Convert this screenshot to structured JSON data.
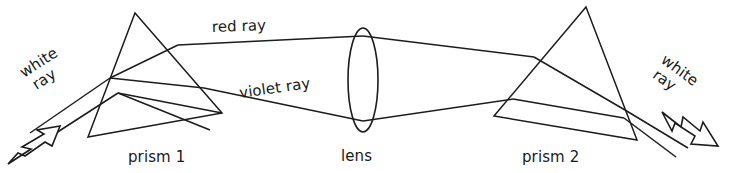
{
  "figure": {
    "background_color": "#ffffff",
    "line_color": "#1c1c1c",
    "width": 734,
    "height": 173
  },
  "labels": {
    "white_ray_left": "white\nray",
    "white_ray_left_line1": "white",
    "white_ray_left_line2": "ray",
    "white_ray_right_line1": "white",
    "white_ray_right_line2": "ray",
    "red_ray": "red ray",
    "violet_ray": "violet ray",
    "prism_1": "prism 1",
    "lens": "lens",
    "prism_2": "prism 2"
  },
  "components": [
    {
      "name": "prism-1",
      "type": "triangle",
      "label": "prism 1",
      "apex": [
        135,
        13
      ],
      "base_left": [
        88,
        137
      ],
      "base_right": [
        222,
        113
      ]
    },
    {
      "name": "lens",
      "type": "ellipse",
      "label": "lens",
      "center": [
        363,
        80
      ],
      "rx": 15,
      "ry": 52
    },
    {
      "name": "prism-2",
      "type": "triangle",
      "label": "prism 2",
      "apex": [
        586,
        7
      ],
      "base_left": [
        494,
        116
      ],
      "base_right": [
        637,
        140
      ]
    }
  ],
  "rays": [
    {
      "name": "white-ray-incoming",
      "label": "white ray",
      "color_name": "white",
      "direction": "into prism 1 from lower left",
      "arrowhead": "outlined-notched-arrow",
      "arrow_points_toward": "upper-right"
    },
    {
      "name": "red-ray",
      "label": "red ray",
      "color_name": "red",
      "path": "upper dispersed ray from prism 1 through lens to prism 2"
    },
    {
      "name": "violet-ray",
      "label": "violet ray",
      "color_name": "violet",
      "path": "lower dispersed ray from prism 1 through lens to prism 2"
    },
    {
      "name": "white-ray-outgoing",
      "label": "white ray",
      "color_name": "white",
      "direction": "out of prism 2 toward lower right",
      "arrowhead": "outlined-notched-arrow",
      "arrow_points_toward": "lower-right"
    }
  ]
}
